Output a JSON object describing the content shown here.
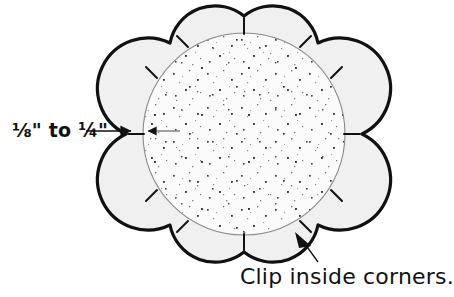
{
  "figure": {
    "background_color": "#ffffff",
    "shape": {
      "name": "scalloped-circle",
      "lobes": 8,
      "center_x": 244,
      "center_y": 134,
      "outer_radius": 118,
      "lobe_depth": 22,
      "seam_band_width": 13,
      "outer_stroke_color": "#111111",
      "outer_stroke_width": 3.2,
      "seam_band_fill": "#f0f0f0",
      "inner_stitch_line_color": "#8c8c8c",
      "inner_stitch_line_width": 1.1,
      "interior_fill": "#fbfbfb",
      "speckle_color": "#3a3a3a"
    },
    "clip_marks": {
      "name": "inside-corner-clips",
      "count": 8,
      "color": "#111111",
      "stroke_width": 2.0
    }
  },
  "annotations": {
    "seam_allowance": {
      "name": "seam-allowance-label",
      "text": "⅛\" to ¼\"",
      "color": "#111111",
      "arrow_color": "#111111",
      "outer_arrow": {
        "x1": 86,
        "y1": 131,
        "x2": 133,
        "y2": 131
      },
      "inner_arrow": {
        "x1": 178,
        "y1": 131,
        "x2": 146,
        "y2": 131
      }
    },
    "clip_caption": {
      "name": "clip-caption",
      "text": "Clip inside corners.",
      "color": "#111111",
      "leader_line": {
        "x1": 318,
        "y1": 262,
        "x2": 302,
        "y2": 240
      },
      "arrow_color": "#111111"
    }
  }
}
